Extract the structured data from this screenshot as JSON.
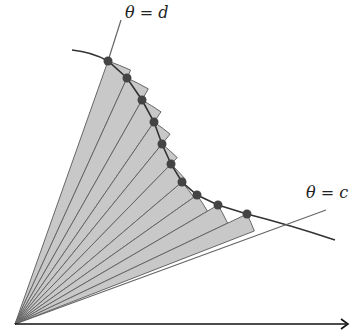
{
  "diagram": {
    "labels": {
      "upper_ray": "θ = d",
      "lower_ray": "θ = c"
    },
    "sector_count": 10,
    "sample_point_count": 11,
    "colors": {
      "sector_fill": "#c8c8c8",
      "sector_stroke": "#666666",
      "curve": "#333333",
      "point": "#444444",
      "axis": "#111111",
      "ray": "#666666"
    }
  }
}
